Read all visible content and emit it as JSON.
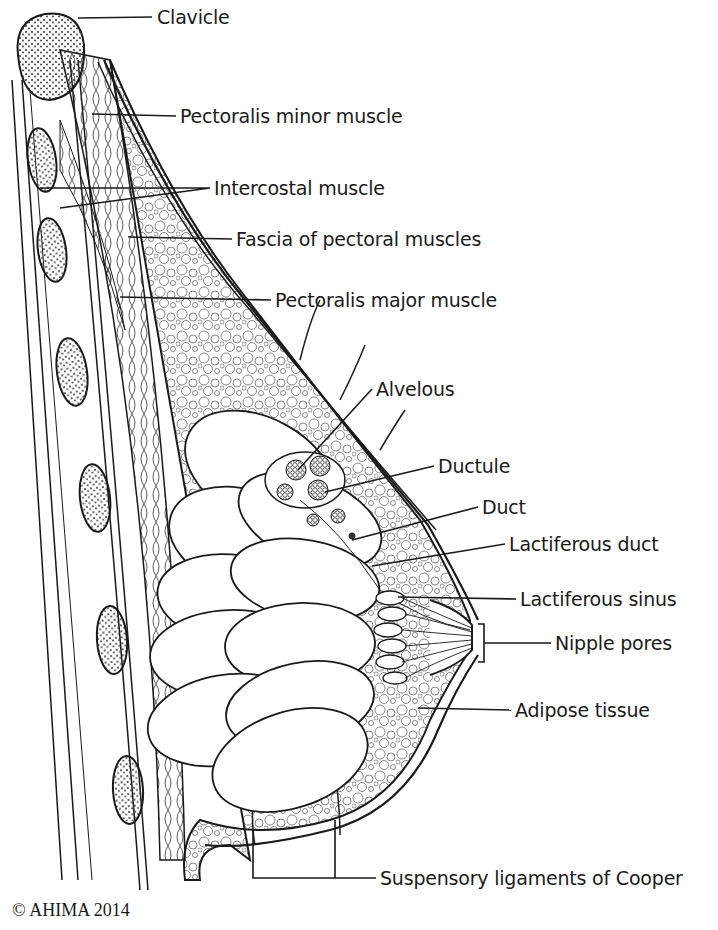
{
  "diagram": {
    "labels": [
      {
        "id": "clavicle",
        "text": "Clavicle",
        "x": 157,
        "y": 6
      },
      {
        "id": "pectoralis-minor",
        "text": "Pectoralis minor muscle",
        "x": 180,
        "y": 105
      },
      {
        "id": "intercostal",
        "text": "Intercostal muscle",
        "x": 214,
        "y": 177
      },
      {
        "id": "fascia",
        "text": "Fascia of pectoral muscles",
        "x": 236,
        "y": 228
      },
      {
        "id": "pectoralis-major",
        "text": "Pectoralis major muscle",
        "x": 275,
        "y": 289
      },
      {
        "id": "alveolus",
        "text": "Alvelous",
        "x": 376,
        "y": 378
      },
      {
        "id": "ductule",
        "text": "Ductule",
        "x": 438,
        "y": 455
      },
      {
        "id": "duct",
        "text": "Duct",
        "x": 482,
        "y": 496
      },
      {
        "id": "lactiferous-duct",
        "text": "Lactiferous duct",
        "x": 509,
        "y": 533
      },
      {
        "id": "lactiferous-sinus",
        "text": "Lactiferous sinus",
        "x": 520,
        "y": 588
      },
      {
        "id": "nipple-pores",
        "text": "Nipple pores",
        "x": 555,
        "y": 632
      },
      {
        "id": "adipose",
        "text": "Adipose tissue",
        "x": 515,
        "y": 699
      },
      {
        "id": "cooper",
        "text": "Suspensory ligaments of Cooper",
        "x": 380,
        "y": 867
      }
    ],
    "copyright": "© AHIMA 2014"
  },
  "colors": {
    "ink": "#1a1a1a",
    "background": "#ffffff"
  }
}
